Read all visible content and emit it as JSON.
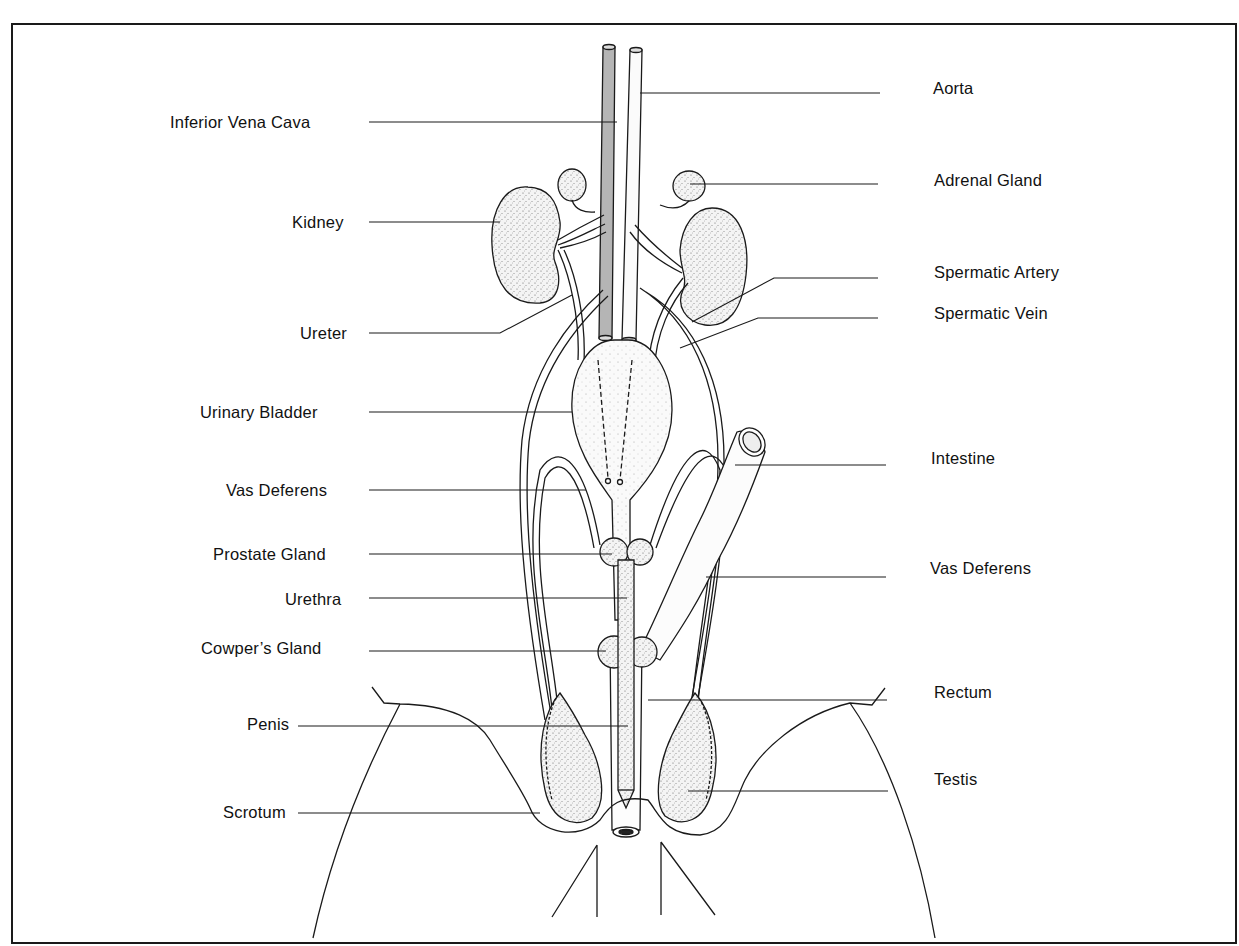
{
  "diagram": {
    "colors": {
      "line": "#1a1a1a",
      "vena_cava_fill": "#b8b8b8",
      "organ_fill": "#f2f2f2",
      "stipple": "#555555"
    },
    "labels_left": [
      {
        "id": "inferior-vena-cava",
        "text": "Inferior Vena Cava"
      },
      {
        "id": "kidney",
        "text": "Kidney"
      },
      {
        "id": "ureter",
        "text": "Ureter"
      },
      {
        "id": "urinary-bladder",
        "text": "Urinary Bladder"
      },
      {
        "id": "vas-deferens-left",
        "text": "Vas Deferens"
      },
      {
        "id": "prostate-gland",
        "text": "Prostate Gland"
      },
      {
        "id": "urethra",
        "text": "Urethra"
      },
      {
        "id": "cowpers-gland",
        "text": "Cowper’s Gland"
      },
      {
        "id": "penis",
        "text": "Penis"
      },
      {
        "id": "scrotum",
        "text": "Scrotum"
      }
    ],
    "labels_right": [
      {
        "id": "aorta",
        "text": "Aorta"
      },
      {
        "id": "adrenal-gland",
        "text": "Adrenal Gland"
      },
      {
        "id": "spermatic-artery",
        "text": "Spermatic Artery"
      },
      {
        "id": "spermatic-vein",
        "text": "Spermatic Vein"
      },
      {
        "id": "intestine",
        "text": "Intestine"
      },
      {
        "id": "vas-deferens-right",
        "text": "Vas Deferens"
      },
      {
        "id": "rectum",
        "text": "Rectum"
      },
      {
        "id": "testis",
        "text": "Testis"
      }
    ]
  }
}
